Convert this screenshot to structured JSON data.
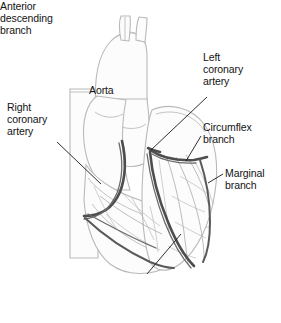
{
  "figure": {
    "kind": "anatomical-line-drawing",
    "background_color": "#ffffff",
    "artery_color": "#4a4a4a",
    "vessel_outline_color": "#b9b9b9",
    "fine_vessel_color": "#9a9a9a",
    "leader_line_color": "#1a1a1a",
    "text_color": "#131313"
  },
  "labels": {
    "aorta": "Aorta",
    "right_coronary_artery": "Right\ncoronary\nartery",
    "left_coronary_artery": "Left\ncoronary\nartery",
    "circumflex_branch": "Circumflex\nbranch",
    "marginal_branch": "Marginal\nbranch",
    "anterior_descending_branch": "Anterior\ndescending\nbranch"
  },
  "structures": [
    {
      "name": "aortic-arch",
      "label": "Aorta"
    },
    {
      "name": "superior-vena-cava",
      "label": ""
    },
    {
      "name": "pulmonary-trunk",
      "label": ""
    },
    {
      "name": "right-atrium",
      "label": ""
    },
    {
      "name": "right-ventricle",
      "label": ""
    },
    {
      "name": "left-ventricle",
      "label": ""
    },
    {
      "name": "right-coronary-artery",
      "label": "Right coronary artery"
    },
    {
      "name": "left-coronary-artery",
      "label": "Left coronary artery"
    },
    {
      "name": "circumflex-branch",
      "label": "Circumflex branch"
    },
    {
      "name": "marginal-branch",
      "label": "Marginal branch"
    },
    {
      "name": "anterior-descending-branch",
      "label": "Anterior descending branch"
    }
  ]
}
